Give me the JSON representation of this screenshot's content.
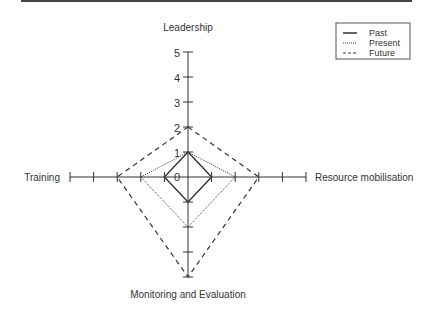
{
  "chart_data": {
    "type": "radar",
    "title": "",
    "axes": [
      "Leadership",
      "Resource mobilisation",
      "Monitoring and Evaluation",
      "Training"
    ],
    "scale": {
      "min": 0,
      "max": 5,
      "ticks": [
        0,
        1,
        2,
        3,
        4,
        5
      ]
    },
    "series": [
      {
        "name": "Past",
        "style": "solid",
        "values": [
          1,
          1,
          1,
          1
        ]
      },
      {
        "name": "Present",
        "style": "dotted",
        "values": [
          1,
          2,
          2,
          2
        ]
      },
      {
        "name": "Future",
        "style": "dashed",
        "values": [
          2,
          3,
          4,
          3
        ]
      }
    ],
    "legend_position": "top-right",
    "grid": false
  },
  "labels": {
    "top": "Leadership",
    "right": "Resource mobilisation",
    "bottom": "Monitoring and Evaluation",
    "left": "Training"
  },
  "tick_labels": [
    "0",
    "1",
    "2",
    "3",
    "4",
    "5"
  ],
  "legend": {
    "past": "Past",
    "present": "Present",
    "future": "Future"
  },
  "colors": {
    "line": "#333333",
    "rule": "#444444"
  }
}
